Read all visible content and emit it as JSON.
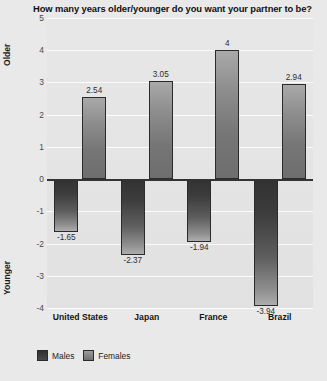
{
  "chart_data": {
    "type": "bar",
    "title": "How many years older/younger do you want your partner to be?",
    "xlabel": "",
    "ylabel": "",
    "categories": [
      "United States",
      "Japan",
      "France",
      "Brazil"
    ],
    "series": [
      {
        "name": "Males",
        "values": [
          -1.65,
          -2.37,
          -1.94,
          -3.94
        ],
        "labels": [
          "-1.65",
          "-2.37",
          "-1.94",
          "-3.94"
        ],
        "color": "#3a3a3a"
      },
      {
        "name": "Females",
        "values": [
          2.54,
          3.05,
          4,
          2.94
        ],
        "labels": [
          "2.54",
          "3.05",
          "4",
          "2.94"
        ],
        "color": "#808080"
      }
    ],
    "ylim": [
      -4,
      5
    ],
    "yticks": [
      5,
      4,
      3,
      2,
      1,
      0,
      -1,
      -2,
      -3,
      -4
    ],
    "ytick_labels": [
      "5",
      "4",
      "3",
      "2",
      "1",
      "0",
      "-1",
      "-2",
      "-3",
      "-4"
    ],
    "grid": true,
    "legend_position": "bottom-left",
    "axis_captions": {
      "top": "Older",
      "bottom": "Younger"
    }
  },
  "colors": {
    "background": "#e9e9e9",
    "plot_background": "#e4e4e4",
    "gridline": "#fbfbfb",
    "zero_line": "#333333",
    "males": "#3a3a3a",
    "females": "#808080",
    "text": "#1a1a1a"
  }
}
